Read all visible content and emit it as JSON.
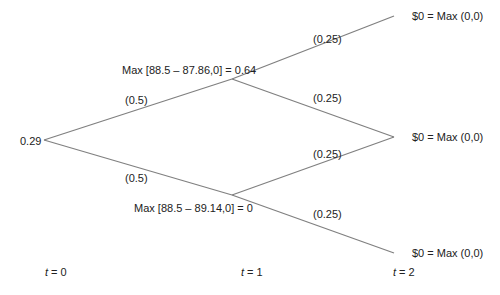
{
  "diagram": {
    "type": "binomial-tree",
    "root": {
      "value": "0.29"
    },
    "t1_nodes": [
      {
        "label": "Max [88.5 – 87.86,0] = 0.64"
      },
      {
        "label": "Max [88.5 – 89.14,0] = 0"
      }
    ],
    "t2_nodes": [
      {
        "label": "$0 = Max (0,0)"
      },
      {
        "label": "$0 = Max (0,0)"
      },
      {
        "label": "$0 = Max (0,0)"
      }
    ],
    "probabilities": {
      "root_up": "(0.5)",
      "root_down": "(0.5)",
      "up_up": "(0.25)",
      "up_down": "(0.25)",
      "down_up": "(0.25)",
      "down_down": "(0.25)"
    },
    "time_labels": [
      {
        "var": "t",
        "rest": " = 0"
      },
      {
        "var": "t",
        "rest": " = 1"
      },
      {
        "var": "t",
        "rest": " = 2"
      }
    ],
    "line_color": "#808080"
  }
}
